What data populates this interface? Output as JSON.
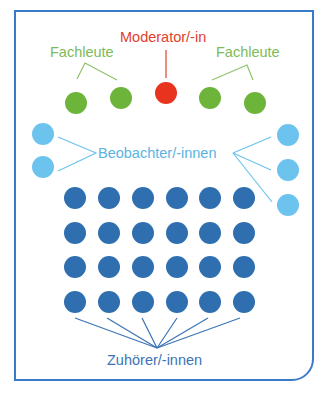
{
  "colors": {
    "frame": "#3a7bc8",
    "moderator": "#e8331f",
    "experts": "#6cb43a",
    "observers": "#6cc3ee",
    "listeners": "#2f6fb0"
  },
  "labels": {
    "moderator": "Moderator/-in",
    "experts_left": "Fachleute",
    "experts_right": "Fachleute",
    "observers": "Beobachter/-innen",
    "listeners": "Zuhörer/-innen"
  },
  "groups": {
    "moderator": {
      "count": 1
    },
    "experts": {
      "count": 4
    },
    "observers": {
      "count": 5,
      "left": 2,
      "right": 3
    },
    "listeners": {
      "count": 24,
      "rows": 4,
      "columns": 6
    }
  }
}
